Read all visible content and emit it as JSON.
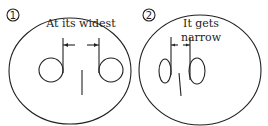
{
  "panels": [
    {
      "number": "1",
      "caption_lines": [
        "At its widest"
      ],
      "description": "Pupil-like mark: two circles with stems far apart, measured at widest gap"
    },
    {
      "number": "2",
      "caption_lines": [
        "It  gets",
        "narrow"
      ],
      "description": "Two circles with stems close together, measured at narrow gap"
    }
  ]
}
